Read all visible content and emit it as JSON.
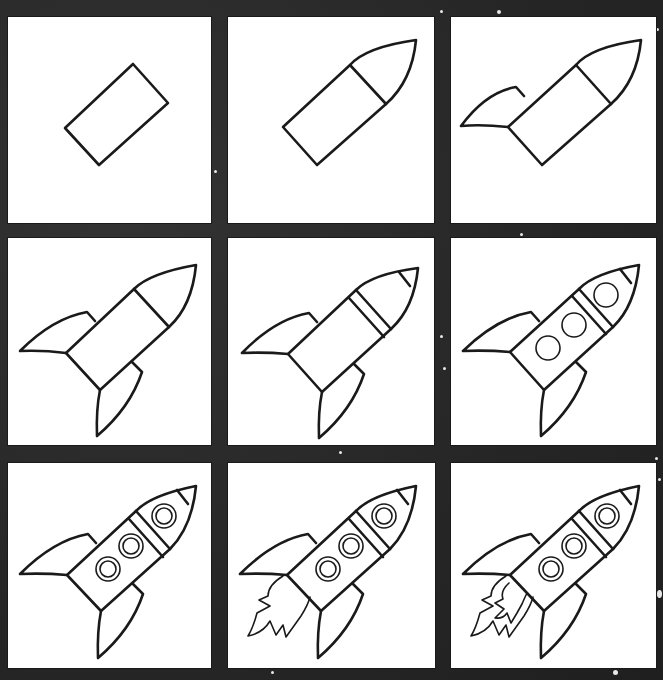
{
  "background_color": "#2b2b2b",
  "panel_color": "#ffffff",
  "line_color": "#1a1a1a",
  "grid": {
    "rows": 3,
    "columns": 3
  },
  "steps": [
    {
      "step": 1,
      "label": "Step 1",
      "description": "Draw a tilted rectangle for the rocket body"
    },
    {
      "step": 2,
      "label": "Step 2",
      "description": "Add a pointed nose cone to the top of the body"
    },
    {
      "step": 3,
      "label": "Step 3",
      "description": "Add the left fin"
    },
    {
      "step": 4,
      "label": "Step 4",
      "description": "Add the bottom fin"
    },
    {
      "step": 5,
      "label": "Step 5",
      "description": "Add a band below the nose and a tip at the top"
    },
    {
      "step": 6,
      "label": "Step 6",
      "description": "Draw three round windows"
    },
    {
      "step": 7,
      "label": "Step 7",
      "description": "Add inner rings to the windows"
    },
    {
      "step": 8,
      "label": "Step 8",
      "description": "Draw the outer exhaust flame"
    },
    {
      "step": 9,
      "label": "Step 9",
      "description": "Add the inner flame"
    }
  ]
}
